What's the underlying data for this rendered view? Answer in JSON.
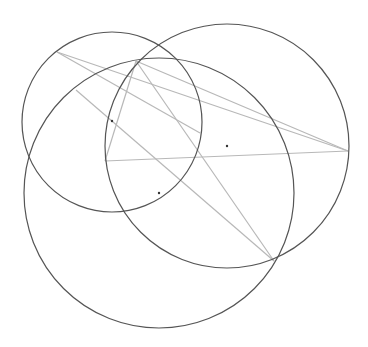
{
  "canvas": {
    "width": 368,
    "height": 347,
    "background": "#ffffff"
  },
  "colors": {
    "circle": "#555555",
    "segment": "#b8b8b8",
    "point": "#333333"
  },
  "circles": [
    {
      "name": "upper-left-circle",
      "cx": 112,
      "cy": 122,
      "r": 90
    },
    {
      "name": "right-circle",
      "cx": 227,
      "cy": 146,
      "r": 122
    },
    {
      "name": "lower-circle",
      "cx": 159,
      "cy": 193,
      "r": 135
    }
  ],
  "segments": [
    {
      "x1": 57,
      "y1": 52,
      "x2": 348,
      "y2": 151
    },
    {
      "x1": 136,
      "y1": 61,
      "x2": 348,
      "y2": 151
    },
    {
      "x1": 105,
      "y1": 161,
      "x2": 348,
      "y2": 151
    },
    {
      "x1": 136,
      "y1": 61,
      "x2": 105,
      "y2": 161
    },
    {
      "x1": 136,
      "y1": 61,
      "x2": 274,
      "y2": 261
    },
    {
      "x1": 76,
      "y1": 90,
      "x2": 274,
      "y2": 261
    },
    {
      "x1": 57,
      "y1": 52,
      "x2": 200,
      "y2": 133
    }
  ],
  "points": [
    {
      "name": "center-upper-left",
      "x": 112,
      "y": 121
    },
    {
      "name": "center-right",
      "x": 227,
      "y": 146
    },
    {
      "name": "center-lower",
      "x": 159,
      "y": 193
    }
  ]
}
